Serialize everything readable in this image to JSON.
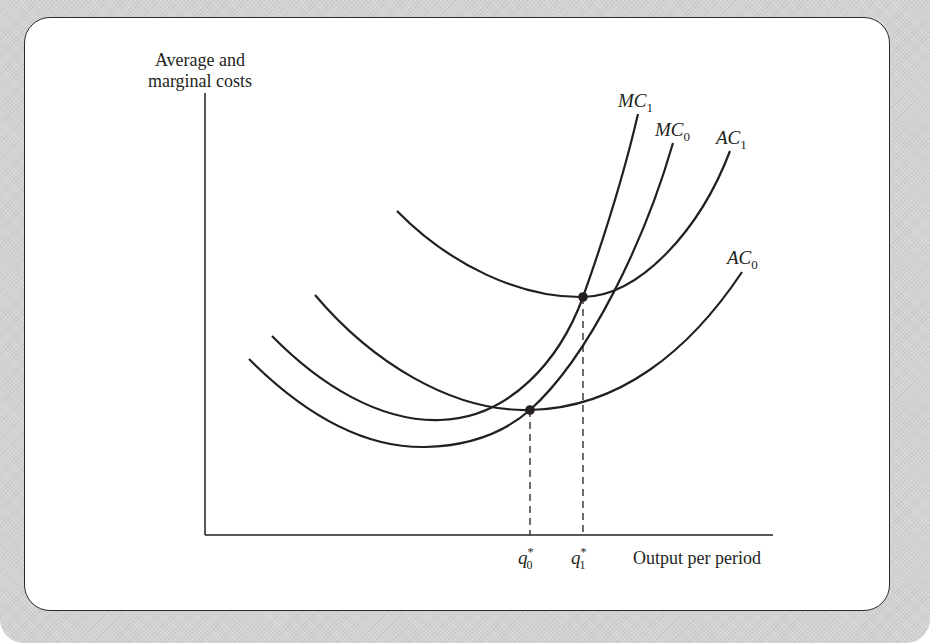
{
  "figure": {
    "y_axis_label_line1": "Average and",
    "y_axis_label_line2": "marginal costs",
    "x_axis_label": "Output per period",
    "curve_labels": {
      "MC1": {
        "base": "MC",
        "sub": "1"
      },
      "MC0": {
        "base": "MC",
        "sub": "0"
      },
      "AC1": {
        "base": "AC",
        "sub": "1"
      },
      "AC0": {
        "base": "AC",
        "sub": "0"
      }
    },
    "tick_labels": {
      "q0": {
        "base": "q",
        "sub": "0",
        "sup": "*"
      },
      "q1": {
        "base": "q",
        "sub": "1",
        "sup": "*"
      }
    },
    "colors": {
      "line": "#231f20",
      "background_frame": "#d2d2d2",
      "panel": "#ffffff"
    }
  }
}
